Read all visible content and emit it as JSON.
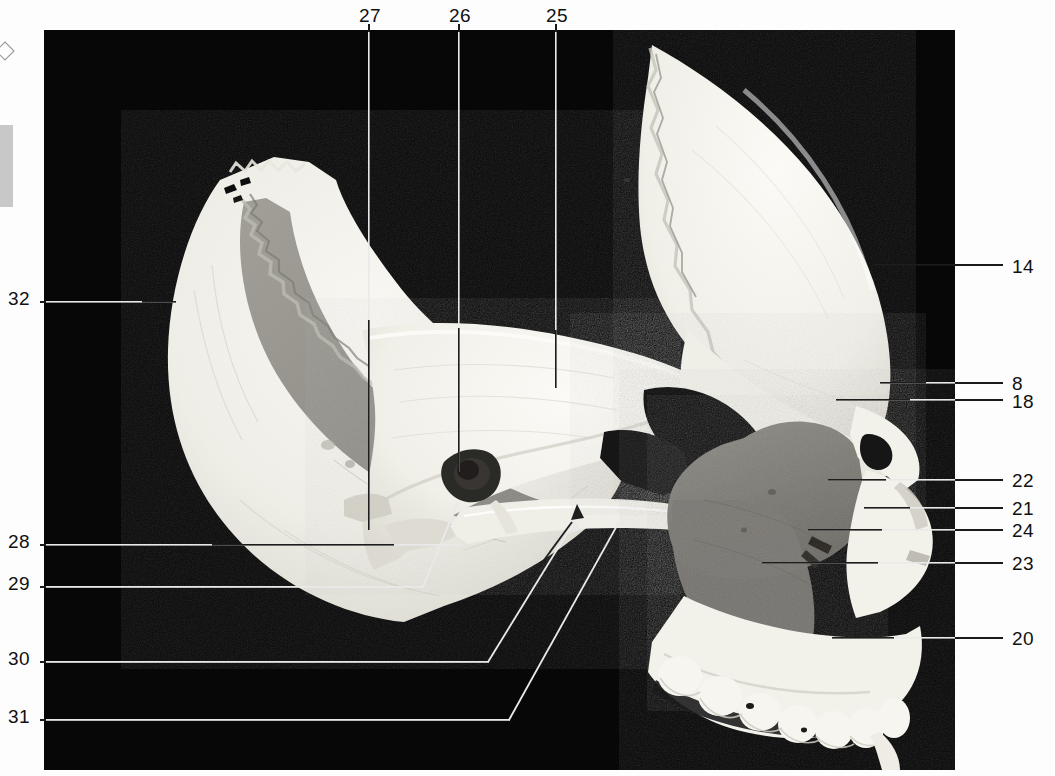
{
  "figure": {
    "kind": "anatomical-photograph",
    "background_color": "#060606",
    "page_color": "#fdfdfd",
    "bone_color": "#f0efe9",
    "bone_shadow_color": "#8a8a8a",
    "cavity_color": "#141414"
  },
  "labels": {
    "top": [
      {
        "id": "27",
        "text": "27",
        "x": 359,
        "y": 6,
        "line_x": 369,
        "line_y1": 30,
        "line_y2": 530
      },
      {
        "id": "26",
        "text": "26",
        "x": 449,
        "y": 6,
        "line_x": 459,
        "line_y1": 30,
        "line_y2": 472
      },
      {
        "id": "25",
        "text": "25",
        "x": 546,
        "y": 6,
        "line_x": 556,
        "line_y1": 30,
        "line_y2": 388
      }
    ],
    "right": [
      {
        "id": "14",
        "text": "14",
        "x": 1012,
        "y": 257,
        "line_x1": 916,
        "line_x2": 1002,
        "line_y": 265
      },
      {
        "id": "8",
        "text": "8",
        "x": 1012,
        "y": 374,
        "line_x1": 880,
        "line_x2": 1002,
        "line_y": 383
      },
      {
        "id": "18",
        "text": "18",
        "x": 1012,
        "y": 392,
        "line_x1": 836,
        "line_x2": 1002,
        "line_y": 400
      },
      {
        "id": "22",
        "text": "22",
        "x": 1012,
        "y": 471,
        "line_x1": 828,
        "line_x2": 1002,
        "line_y": 480
      },
      {
        "id": "21",
        "text": "21",
        "x": 1012,
        "y": 499,
        "line_x1": 864,
        "line_x2": 1002,
        "line_y": 508
      },
      {
        "id": "24",
        "text": "24",
        "x": 1012,
        "y": 521,
        "line_x1": 808,
        "line_x2": 1002,
        "line_y": 530
      },
      {
        "id": "23",
        "text": "23",
        "x": 1012,
        "y": 554,
        "line_x1": 762,
        "line_x2": 1002,
        "line_y": 563
      },
      {
        "id": "20",
        "text": "20",
        "x": 1012,
        "y": 629,
        "line_x1": 832,
        "line_x2": 1002,
        "line_y": 638
      }
    ],
    "left": [
      {
        "id": "32",
        "text": "32",
        "x": 8,
        "y": 289,
        "line_x1": 40,
        "line_x2": 176,
        "line_y": 302
      },
      {
        "id": "28",
        "text": "28",
        "x": 8,
        "y": 532,
        "line_x1": 40,
        "line_x2": 462,
        "line_y": 545
      },
      {
        "id": "29",
        "text": "29",
        "x": 8,
        "y": 574,
        "line_x1": 40,
        "line_x2": 462,
        "line_y": 587
      },
      {
        "id": "30",
        "text": "30",
        "x": 8,
        "y": 649,
        "line_x1": 40,
        "line_x2": 486,
        "line_y": 662
      },
      {
        "id": "31",
        "text": "31",
        "x": 8,
        "y": 707,
        "line_x1": 40,
        "line_x2": 508,
        "line_y": 720
      }
    ],
    "count": 16
  },
  "annotation_ids": [
    "8",
    "14",
    "18",
    "20",
    "21",
    "22",
    "23",
    "24",
    "25",
    "26",
    "27",
    "28",
    "29",
    "30",
    "31",
    "32"
  ]
}
